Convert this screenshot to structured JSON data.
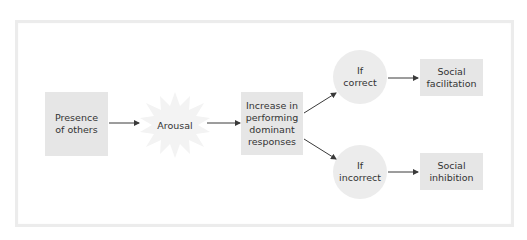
{
  "diagram": {
    "type": "flowchart",
    "title": "",
    "nodes": {
      "presence": {
        "lines": [
          "Presence",
          "of others"
        ],
        "shape": "rectangle"
      },
      "arousal": {
        "lines": [
          "Arousal"
        ],
        "shape": "starburst"
      },
      "increase": {
        "lines": [
          "Increase in",
          "performing",
          "dominant",
          "responses"
        ],
        "shape": "rectangle"
      },
      "correct": {
        "lines": [
          "If",
          "correct"
        ],
        "shape": "circle"
      },
      "incorrect": {
        "lines": [
          "If",
          "incorrect"
        ],
        "shape": "circle"
      },
      "facilitation": {
        "lines": [
          "Social",
          "facilitation"
        ],
        "shape": "rectangle"
      },
      "inhibition": {
        "lines": [
          "Social",
          "inhibition"
        ],
        "shape": "rectangle"
      }
    },
    "edges": [
      {
        "from": "presence",
        "to": "arousal"
      },
      {
        "from": "arousal",
        "to": "increase"
      },
      {
        "from": "increase",
        "to": "correct"
      },
      {
        "from": "increase",
        "to": "incorrect"
      },
      {
        "from": "correct",
        "to": "facilitation"
      },
      {
        "from": "incorrect",
        "to": "inhibition"
      }
    ],
    "colors": {
      "node_fill": "#e6e6e6",
      "circle_fill": "#ececec",
      "arrow": "#3a3a3a",
      "frame_border": "#ececec"
    }
  }
}
